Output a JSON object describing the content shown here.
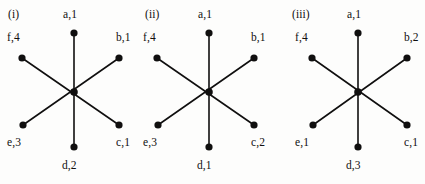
{
  "figure": {
    "background_color": "#fdfdfc",
    "ink_color": "#100f0f",
    "panels": [
      {
        "roman_label": "(i)",
        "vertices": [
          {
            "id": "a",
            "label": "a,1",
            "letter": "a",
            "number": 1,
            "position": "top"
          },
          {
            "id": "b",
            "label": "b,1",
            "letter": "b",
            "number": 1,
            "position": "upper-right"
          },
          {
            "id": "c",
            "label": "c,1",
            "letter": "c",
            "number": 1,
            "position": "lower-right"
          },
          {
            "id": "d",
            "label": "d,2",
            "letter": "d",
            "number": 2,
            "position": "bottom"
          },
          {
            "id": "e",
            "label": "e,3",
            "letter": "e",
            "number": 3,
            "position": "lower-left"
          },
          {
            "id": "f",
            "label": "f,4",
            "letter": "f",
            "number": 4,
            "position": "upper-left"
          }
        ]
      },
      {
        "roman_label": "(ii)",
        "vertices": [
          {
            "id": "a",
            "label": "a,1",
            "letter": "a",
            "number": 1,
            "position": "top"
          },
          {
            "id": "b",
            "label": "b,1",
            "letter": "b",
            "number": 1,
            "position": "upper-right"
          },
          {
            "id": "c",
            "label": "c,2",
            "letter": "c",
            "number": 2,
            "position": "lower-right"
          },
          {
            "id": "d",
            "label": "d,1",
            "letter": "d",
            "number": 1,
            "position": "bottom"
          },
          {
            "id": "e",
            "label": "e,3",
            "letter": "e",
            "number": 3,
            "position": "lower-left"
          },
          {
            "id": "f",
            "label": "f,4",
            "letter": "f",
            "number": 4,
            "position": "upper-left"
          }
        ]
      },
      {
        "roman_label": "(iii)",
        "vertices": [
          {
            "id": "a",
            "label": "a,1",
            "letter": "a",
            "number": 1,
            "position": "top"
          },
          {
            "id": "b",
            "label": "b,2",
            "letter": "b",
            "number": 2,
            "position": "upper-right"
          },
          {
            "id": "c",
            "label": "c,1",
            "letter": "c",
            "number": 1,
            "position": "lower-right"
          },
          {
            "id": "d",
            "label": "d,3",
            "letter": "d",
            "number": 3,
            "position": "bottom"
          },
          {
            "id": "e",
            "label": "e,1",
            "letter": "e",
            "number": 1,
            "position": "lower-left"
          },
          {
            "id": "f",
            "label": "f,4",
            "letter": "f",
            "number": 4,
            "position": "upper-left"
          }
        ]
      }
    ]
  }
}
